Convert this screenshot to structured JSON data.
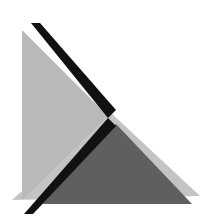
{
  "image": {
    "description": "Abstract geometric composition of overlapping triangles",
    "width": 216,
    "height": 217
  },
  "colors": {
    "background": "#ffffff",
    "light_gray": "#b9b9b9",
    "lighter_gray": "#c4c4c4",
    "dark_gray": "#5f5f5f",
    "black": "#111111"
  },
  "shapes": {
    "left_light_triangle": {
      "points": "22,30 22,200 108,116"
    },
    "right_light_triangle": {
      "points": "110,112 200,196 12,200"
    },
    "dark_triangle": {
      "points": "116,124 192,204 42,204"
    },
    "upper_black_band": {
      "points": "31,23 40,23 116,110 108,118"
    },
    "lower_black_band": {
      "points": "108,118 116,126 33,214 24,214"
    }
  }
}
